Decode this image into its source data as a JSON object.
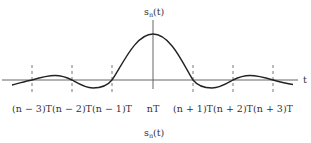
{
  "diagram": {
    "title_label": "s",
    "title_sub": "n",
    "title_arg": "(t)",
    "axis_label": "t",
    "caption": "s",
    "caption_sub": "n",
    "caption_arg": "(t)",
    "ticks": [
      {
        "label": "(n − 3)T"
      },
      {
        "label": "(n − 2)T"
      },
      {
        "label": "(n − 1)T"
      },
      {
        "label": "nT"
      },
      {
        "label": "(n + 1)T"
      },
      {
        "label": "(n + 2)T"
      },
      {
        "label": "(n + 3)T"
      }
    ],
    "colors": {
      "line": "#222222",
      "axis": "#555555",
      "text": "#333333"
    }
  }
}
